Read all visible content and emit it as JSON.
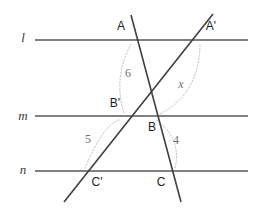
{
  "figure": {
    "canvas": {
      "width": 265,
      "height": 216
    },
    "colors": {
      "parallel_line": "#575757",
      "transversal_line": "#3f3f3f",
      "arc": "#c0c0c0",
      "point_label": "#1d1d1d",
      "measure_label": "#6f6f6f",
      "line_label": "#3a3a3a",
      "background": "#ffffff"
    },
    "parallel_lines": [
      {
        "name": "l",
        "label": "l",
        "y": 40,
        "x1": 35,
        "x2": 248,
        "label_x": 23,
        "label_y": 39
      },
      {
        "name": "m",
        "label": "m",
        "y": 116,
        "x1": 35,
        "x2": 248,
        "label_x": 23,
        "label_y": 117
      },
      {
        "name": "n",
        "label": "n",
        "y": 171,
        "x1": 35,
        "x2": 248,
        "label_x": 23,
        "label_y": 171
      }
    ],
    "transversals": [
      {
        "name": "transversal-A-C",
        "through": [
          "A",
          "B",
          "C"
        ],
        "x1": 131,
        "y1": 15,
        "x2": 181,
        "y2": 202
      },
      {
        "name": "transversal-Cprime-Aprime",
        "through": [
          "C'",
          "B'",
          "A'"
        ],
        "x1": 64,
        "y1": 202,
        "x2": 213,
        "y2": 14
      }
    ],
    "points": [
      {
        "name": "A",
        "label": "A",
        "x": 131,
        "y": 40,
        "label_x": 121,
        "label_y": 27
      },
      {
        "name": "Aprime",
        "label": "A'",
        "x": 200,
        "y": 40,
        "label_x": 211,
        "label_y": 27
      },
      {
        "name": "Bprime",
        "label": "B'",
        "x": 122,
        "y": 116,
        "label_x": 115,
        "label_y": 104
      },
      {
        "name": "B",
        "label": "B",
        "x": 155,
        "y": 116,
        "label_x": 152,
        "label_y": 128
      },
      {
        "name": "Cprime",
        "label": "C'",
        "x": 88,
        "y": 171,
        "label_x": 97,
        "label_y": 183
      },
      {
        "name": "C",
        "label": "C",
        "x": 172,
        "y": 171,
        "label_x": 161,
        "label_y": 183
      }
    ],
    "measures": [
      {
        "name": "segment-A-Bprime",
        "label": "6",
        "italic": false,
        "label_x": 128,
        "label_y": 74,
        "arc": {
          "x1": 131,
          "y1": 44,
          "x2": 124,
          "y2": 113,
          "cx": 113,
          "cy": 78
        }
      },
      {
        "name": "segment-Aprime-B",
        "label": "x",
        "italic": true,
        "label_x": 181,
        "label_y": 85,
        "arc": {
          "x1": 200,
          "y1": 45,
          "x2": 160,
          "y2": 114,
          "cx": 199,
          "cy": 94
        }
      },
      {
        "name": "segment-Bprime-Cprime",
        "label": "5",
        "italic": false,
        "label_x": 88,
        "label_y": 140,
        "arc": {
          "x1": 119,
          "y1": 120,
          "x2": 85,
          "y2": 168,
          "cx": 103,
          "cy": 125
        }
      },
      {
        "name": "segment-B-C",
        "label": "4",
        "italic": false,
        "label_x": 176,
        "label_y": 141,
        "arc": {
          "x1": 157,
          "y1": 120,
          "x2": 175,
          "y2": 168,
          "cx": 182,
          "cy": 140
        }
      }
    ]
  }
}
